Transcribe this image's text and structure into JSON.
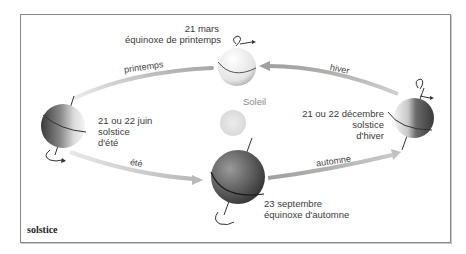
{
  "caption": "solstice",
  "sun": {
    "label": "Soleil"
  },
  "positions": {
    "spring_equinox": {
      "date": "21 mars",
      "name": "équinoxe de printemps"
    },
    "summer_solstice": {
      "date": "21 ou 22 juin",
      "line2": "solstice",
      "line3": "d'été"
    },
    "autumn_equinox": {
      "date": "23 septembre",
      "name": "équinoxe d'automne"
    },
    "winter_solstice": {
      "date": "21 ou 22 décembre",
      "line2": "solstice",
      "line3": "d'hiver"
    }
  },
  "seasons": {
    "spring": "printemps",
    "summer": "été",
    "autumn": "automne",
    "winter": "hiver"
  },
  "colors": {
    "frame": "#8a8a8a",
    "arrow": "#b0b0b0",
    "sun": "#e6e6e6",
    "globe_dark": "#4a4a4a",
    "globe_light": "#f2f2f2"
  }
}
